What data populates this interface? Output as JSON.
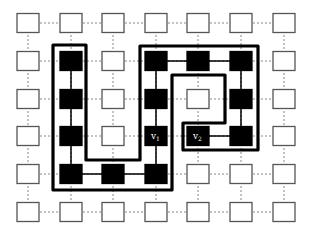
{
  "diagram": {
    "type": "grid-graph",
    "columns": 7,
    "rows": 6,
    "col_x": [
      28,
      71,
      113,
      156,
      198,
      241,
      284
    ],
    "row_y": [
      23,
      61,
      99,
      136,
      174,
      212
    ],
    "node_w": 22,
    "node_h": 19,
    "colors": {
      "filled_node": "#000000",
      "empty_node_border": "#555555",
      "empty_node_fill": "#ffffff",
      "grid_edge": "#888888",
      "solid_edge": "#000000",
      "boundary": "#000000"
    },
    "filled_nodes": [
      [
        1,
        1
      ],
      [
        1,
        2
      ],
      [
        1,
        3
      ],
      [
        1,
        4
      ],
      [
        2,
        4
      ],
      [
        3,
        1
      ],
      [
        3,
        2
      ],
      [
        3,
        3
      ],
      [
        3,
        4
      ],
      [
        4,
        1
      ],
      [
        4,
        3
      ],
      [
        5,
        1
      ],
      [
        5,
        2
      ],
      [
        5,
        3
      ]
    ],
    "solid_edges": [
      [
        [
          1,
          1
        ],
        [
          1,
          4
        ]
      ],
      [
        [
          1,
          4
        ],
        [
          3,
          4
        ]
      ],
      [
        [
          3,
          1
        ],
        [
          3,
          4
        ]
      ],
      [
        [
          3,
          1
        ],
        [
          5,
          1
        ]
      ],
      [
        [
          5,
          1
        ],
        [
          5,
          3
        ]
      ],
      [
        [
          4,
          3
        ],
        [
          5,
          3
        ]
      ]
    ],
    "labels": [
      {
        "text": "v1",
        "main": "v",
        "sub": "1",
        "col": 3,
        "row": 3
      },
      {
        "text": "v2",
        "main": "v",
        "sub": "2",
        "col": 4,
        "row": 3
      }
    ],
    "boundary_path": [
      [
        53,
        45
      ],
      [
        86,
        45
      ],
      [
        86,
        160
      ],
      [
        140,
        160
      ],
      [
        140,
        46
      ],
      [
        258,
        46
      ],
      [
        258,
        150
      ],
      [
        183,
        150
      ],
      [
        183,
        123
      ],
      [
        225,
        123
      ],
      [
        225,
        75
      ],
      [
        172,
        75
      ],
      [
        172,
        190
      ],
      [
        53,
        190
      ]
    ]
  }
}
